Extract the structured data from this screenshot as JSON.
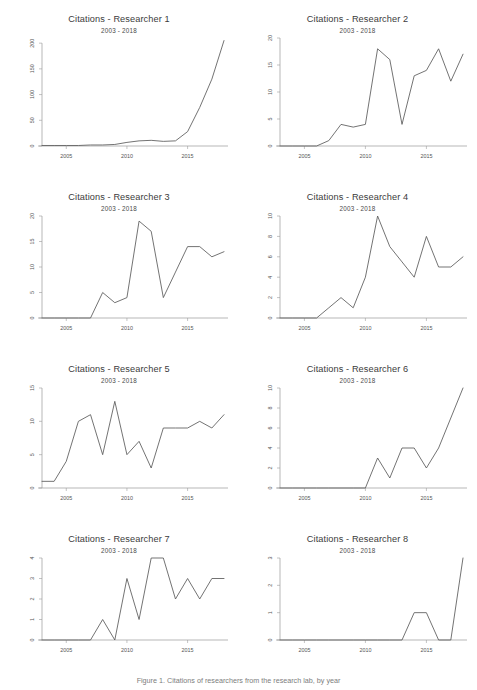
{
  "figure": {
    "caption": "Figure 1. Citations of researchers from the research lab, by year",
    "background_color": "#ffffff",
    "line_color": "#5a5a5a",
    "axis_color": "#9a9a9a",
    "panel_columns": 2,
    "panel_rows": 4
  },
  "chart_data": [
    {
      "type": "line",
      "title": "Citations - Researcher 1",
      "subtitle": "2003 - 2018",
      "xlabel": "",
      "ylabel": "",
      "x": [
        2003,
        2004,
        2005,
        2006,
        2007,
        2008,
        2009,
        2010,
        2011,
        2012,
        2013,
        2014,
        2015,
        2016,
        2017,
        2018
      ],
      "values": [
        1,
        1,
        1,
        1,
        2,
        2,
        3,
        7,
        10,
        11,
        9,
        10,
        28,
        75,
        130,
        205
      ],
      "xticks": [
        2005,
        2010,
        2015
      ],
      "yticks": [
        0,
        50,
        100,
        150,
        200
      ],
      "xlim": [
        2003,
        2018
      ],
      "ylim": [
        0,
        210
      ],
      "grid": false,
      "legend": false
    },
    {
      "type": "line",
      "title": "Citations - Researcher 2",
      "subtitle": "2003 - 2018",
      "xlabel": "",
      "ylabel": "",
      "x": [
        2003,
        2004,
        2005,
        2006,
        2007,
        2008,
        2009,
        2010,
        2011,
        2012,
        2013,
        2014,
        2015,
        2016,
        2017,
        2018
      ],
      "values": [
        0,
        0,
        0,
        0,
        1,
        4,
        3.5,
        4,
        18,
        16,
        4,
        13,
        14,
        18,
        12,
        17
      ],
      "xticks": [
        2005,
        2010,
        2015
      ],
      "yticks": [
        0,
        5,
        10,
        15,
        20
      ],
      "xlim": [
        2003,
        2018
      ],
      "ylim": [
        0,
        20
      ],
      "grid": false,
      "legend": false
    },
    {
      "type": "line",
      "title": "Citations - Researcher 3",
      "subtitle": "2003 - 2018",
      "xlabel": "",
      "ylabel": "",
      "x": [
        2003,
        2004,
        2005,
        2006,
        2007,
        2008,
        2009,
        2010,
        2011,
        2012,
        2013,
        2014,
        2015,
        2016,
        2017,
        2018
      ],
      "values": [
        0,
        0,
        0,
        0,
        0,
        5,
        3,
        4,
        19,
        17,
        4,
        9,
        14,
        14,
        12,
        13
      ],
      "xticks": [
        2005,
        2010,
        2015
      ],
      "yticks": [
        0,
        5,
        10,
        15,
        20
      ],
      "xlim": [
        2003,
        2018
      ],
      "ylim": [
        0,
        20
      ],
      "grid": false,
      "legend": false
    },
    {
      "type": "line",
      "title": "Citations - Researcher 4",
      "subtitle": "2003 - 2018",
      "xlabel": "",
      "ylabel": "",
      "x": [
        2003,
        2004,
        2005,
        2006,
        2007,
        2008,
        2009,
        2010,
        2011,
        2012,
        2013,
        2014,
        2015,
        2016,
        2017,
        2018
      ],
      "values": [
        0,
        0,
        0,
        0,
        1,
        2,
        1,
        4,
        10,
        7,
        5.5,
        4,
        8,
        5,
        5,
        6
      ],
      "xticks": [
        2005,
        2010,
        2015
      ],
      "yticks": [
        0,
        2,
        4,
        6,
        8,
        10
      ],
      "xlim": [
        2003,
        2018
      ],
      "ylim": [
        0,
        10
      ],
      "grid": false,
      "legend": false
    },
    {
      "type": "line",
      "title": "Citations - Researcher 5",
      "subtitle": "2003 - 2018",
      "xlabel": "",
      "ylabel": "",
      "x": [
        2003,
        2004,
        2005,
        2006,
        2007,
        2008,
        2009,
        2010,
        2011,
        2012,
        2013,
        2014,
        2015,
        2016,
        2017,
        2018
      ],
      "values": [
        1,
        1,
        4,
        10,
        11,
        5,
        13,
        5,
        7,
        3,
        9,
        9,
        9,
        10,
        9,
        11
      ],
      "xticks": [
        2005,
        2010,
        2015
      ],
      "yticks": [
        0,
        5,
        10,
        15
      ],
      "xlim": [
        2003,
        2018
      ],
      "ylim": [
        0,
        15
      ],
      "grid": false,
      "legend": false
    },
    {
      "type": "line",
      "title": "Citations - Researcher 6",
      "subtitle": "2003 - 2018",
      "xlabel": "",
      "ylabel": "",
      "x": [
        2003,
        2004,
        2005,
        2006,
        2007,
        2008,
        2009,
        2010,
        2011,
        2012,
        2013,
        2014,
        2015,
        2016,
        2017,
        2018
      ],
      "values": [
        0,
        0,
        0,
        0,
        0,
        0,
        0,
        0,
        3,
        1,
        4,
        4,
        2,
        4,
        7,
        10
      ],
      "xticks": [
        2005,
        2010,
        2015
      ],
      "yticks": [
        0,
        2,
        4,
        6,
        8,
        10
      ],
      "xlim": [
        2003,
        2018
      ],
      "ylim": [
        0,
        10
      ],
      "grid": false,
      "legend": false
    },
    {
      "type": "line",
      "title": "Citations - Researcher 7",
      "subtitle": "2003 - 2018",
      "xlabel": "",
      "ylabel": "",
      "x": [
        2003,
        2004,
        2005,
        2006,
        2007,
        2008,
        2009,
        2010,
        2011,
        2012,
        2013,
        2014,
        2015,
        2016,
        2017,
        2018
      ],
      "values": [
        0,
        0,
        0,
        0,
        0,
        1,
        0,
        3,
        1,
        4,
        4,
        2,
        3,
        2,
        3,
        3
      ],
      "xticks": [
        2005,
        2010,
        2015
      ],
      "yticks": [
        0,
        1,
        2,
        3,
        4
      ],
      "xlim": [
        2003,
        2018
      ],
      "ylim": [
        0,
        4
      ],
      "grid": false,
      "legend": false
    },
    {
      "type": "line",
      "title": "Citations - Researcher 8",
      "subtitle": "2003 - 2018",
      "xlabel": "",
      "ylabel": "",
      "x": [
        2003,
        2004,
        2005,
        2006,
        2007,
        2008,
        2009,
        2010,
        2011,
        2012,
        2013,
        2014,
        2015,
        2016,
        2017,
        2018
      ],
      "values": [
        0,
        0,
        0,
        0,
        0,
        0,
        0,
        0,
        0,
        0,
        0,
        1,
        1,
        0,
        0,
        3
      ],
      "xticks": [
        2005,
        2010,
        2015
      ],
      "yticks": [
        0,
        1,
        2,
        3
      ],
      "xlim": [
        2003,
        2018
      ],
      "ylim": [
        0,
        3
      ],
      "grid": false,
      "legend": false
    }
  ]
}
